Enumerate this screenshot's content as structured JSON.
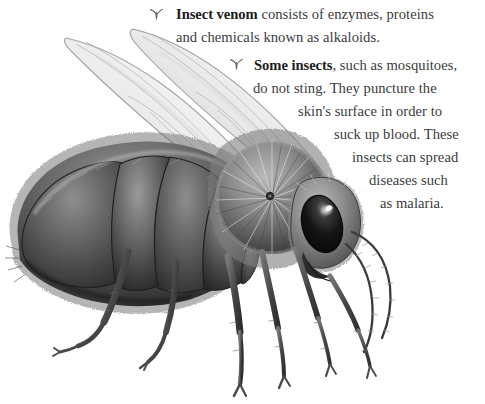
{
  "page": {
    "background_color": "#ffffff",
    "text_color": "#3b3b3b",
    "bold_text_color": "#1d1d1d",
    "bullet_color": "#6d6d6d",
    "width": 485,
    "height": 404
  },
  "illustration": {
    "subject": "honey-bee",
    "style": "grayscale pencil drawing",
    "description": "Side view of a honey bee with two translucent veined wings raised, five segmented furry abdomen, hairy thorax, large dark compound eye with highlight, antennae and six jointed legs",
    "palette": {
      "outline": "#2f2f2f",
      "body_dark": "#3a3a3a",
      "body_mid": "#6f6f6f",
      "body_light": "#a8a8a8",
      "wing": "#d8d8d8",
      "eye": "#161616",
      "eye_highlight": "#f2f2f2"
    }
  },
  "content": {
    "blocks": [
      {
        "id": "block-venom",
        "bullet_icon": "insect-bullet-icon",
        "lead": "Insect venom",
        "lines": [
          {
            "bold": "Insect venom",
            "rest": " consists of enzymes, proteins"
          },
          {
            "bold": "",
            "rest": "and chemicals known as alkaloids."
          }
        ]
      },
      {
        "id": "block-mosquitoes",
        "bullet_icon": "insect-bullet-icon",
        "lead": "Some insects",
        "lines": [
          {
            "bold": "Some insects",
            "rest": ", such as mosquitoes,"
          },
          {
            "bold": "",
            "rest": "do not sting. They puncture the"
          },
          {
            "bold": "",
            "rest": "skin's surface in order to"
          },
          {
            "bold": "",
            "rest": "suck up blood. These"
          },
          {
            "bold": "",
            "rest": "insects can spread"
          },
          {
            "bold": "",
            "rest": "diseases such"
          },
          {
            "bold": "",
            "rest": "as malaria."
          }
        ]
      }
    ],
    "paragraph_1_text": "Insect venom consists of enzymes, proteins and chemicals known as alkaloids.",
    "paragraph_2_text": "Some insects, such as mosquitoes, do not sting. They puncture the skin's surface in order to suck up blood. These insects can spread diseases such as malaria."
  }
}
